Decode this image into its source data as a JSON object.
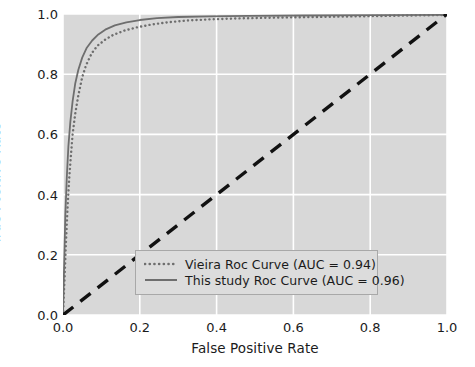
{
  "chart_data": {
    "type": "line",
    "title": "",
    "xlabel": "False Positive Rate",
    "ylabel": "True Positive Rate",
    "xlim": [
      0.0,
      1.0
    ],
    "ylim": [
      0.0,
      1.0
    ],
    "xticks": [
      "0.0",
      "0.2",
      "0.4",
      "0.6",
      "0.8",
      "1.0"
    ],
    "yticks": [
      "1.0",
      "0.8",
      "0.6",
      "0.4",
      "0.2",
      "0.0"
    ],
    "grid": true,
    "grid_color": "#ffffff",
    "plot_background": "#d8d8d8",
    "figure_background": "#ffffff",
    "legend_position": "lower right",
    "series": [
      {
        "name": "Vieira Roc Curve (AUC = 0.94)",
        "label": "Vieira Roc Curve (AUC = 0.94)",
        "auc": 0.94,
        "style": "dotted",
        "color": "#6e6e6e",
        "x": [
          0.0,
          0.004,
          0.008,
          0.012,
          0.016,
          0.02,
          0.025,
          0.032,
          0.04,
          0.05,
          0.06,
          0.075,
          0.09,
          0.11,
          0.13,
          0.16,
          0.19,
          0.23,
          0.27,
          0.32,
          0.38,
          0.45,
          0.55,
          0.7,
          0.85,
          1.0
        ],
        "y": [
          0.0,
          0.12,
          0.25,
          0.36,
          0.45,
          0.52,
          0.6,
          0.67,
          0.73,
          0.79,
          0.83,
          0.87,
          0.895,
          0.915,
          0.93,
          0.945,
          0.955,
          0.965,
          0.972,
          0.978,
          0.982,
          0.985,
          0.988,
          0.991,
          0.994,
          0.997
        ]
      },
      {
        "name": "This study Roc Curve (AUC = 0.96)",
        "label": "This study Roc Curve (AUC = 0.96)",
        "auc": 0.96,
        "style": "solid",
        "color": "#6e6e6e",
        "x": [
          0.0,
          0.003,
          0.006,
          0.01,
          0.014,
          0.019,
          0.025,
          0.032,
          0.04,
          0.05,
          0.062,
          0.076,
          0.092,
          0.11,
          0.135,
          0.165,
          0.2,
          0.245,
          0.3,
          0.38,
          0.48,
          0.62,
          0.8,
          1.0
        ],
        "y": [
          0.0,
          0.17,
          0.33,
          0.46,
          0.56,
          0.64,
          0.71,
          0.77,
          0.815,
          0.855,
          0.888,
          0.912,
          0.932,
          0.948,
          0.962,
          0.972,
          0.98,
          0.986,
          0.99,
          0.992,
          0.994,
          0.995,
          0.996,
          0.997
        ]
      },
      {
        "name": "chance-diagonal",
        "label": "",
        "style": "dashed",
        "color": "#111111",
        "x": [
          0.0,
          1.0
        ],
        "y": [
          0.0,
          1.0
        ]
      }
    ]
  },
  "axes": {
    "xlabel": "False Positive Rate",
    "ylabel": "True Positive Rate",
    "xticks": [
      {
        "label": "0.0",
        "value": 0.0
      },
      {
        "label": "0.2",
        "value": 0.2
      },
      {
        "label": "0.4",
        "value": 0.4
      },
      {
        "label": "0.6",
        "value": 0.6
      },
      {
        "label": "0.8",
        "value": 0.8
      },
      {
        "label": "1.0",
        "value": 1.0
      }
    ],
    "yticks": [
      {
        "label": "1.0",
        "value": 1.0
      },
      {
        "label": "0.8",
        "value": 0.8
      },
      {
        "label": "0.6",
        "value": 0.6
      },
      {
        "label": "0.4",
        "value": 0.4
      },
      {
        "label": "0.2",
        "value": 0.2
      },
      {
        "label": "0.0",
        "value": 0.0
      }
    ]
  },
  "legend": {
    "entries": [
      {
        "label": "Vieira Roc Curve (AUC = 0.94)",
        "style": "dotted"
      },
      {
        "label": "This study Roc Curve (AUC = 0.96)",
        "style": "solid"
      }
    ]
  }
}
